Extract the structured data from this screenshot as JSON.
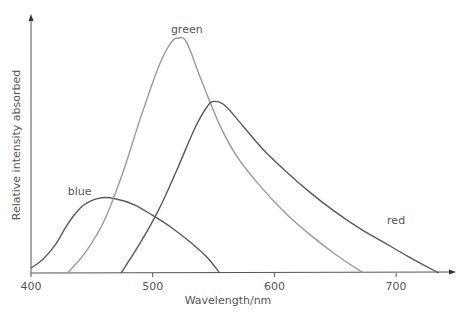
{
  "chart_data": {
    "type": "line",
    "title": "",
    "xlabel": "Wavelength/nm",
    "ylabel": "Relative intensity absorbed",
    "xlim": [
      400,
      745
    ],
    "ylim": [
      0,
      100
    ],
    "x_ticks": [
      400,
      500,
      600,
      700
    ],
    "y_ticks": [],
    "grid": false,
    "legend": "none (inline labels)",
    "series": [
      {
        "name": "blue",
        "color": "#5a5a5a",
        "label_pos": [
          440,
          33
        ],
        "points": [
          [
            400,
            2
          ],
          [
            410,
            6
          ],
          [
            420,
            12
          ],
          [
            428,
            19
          ],
          [
            436,
            25
          ],
          [
            445,
            29.5
          ],
          [
            458,
            32
          ],
          [
            470,
            31.5
          ],
          [
            485,
            29
          ],
          [
            500,
            24.5
          ],
          [
            515,
            19.5
          ],
          [
            530,
            13.5
          ],
          [
            545,
            6.5
          ],
          [
            555,
            0
          ]
        ]
      },
      {
        "name": "green",
        "color": "#9a9a9a",
        "label_pos": [
          528,
          102
        ],
        "points": [
          [
            430,
            0
          ],
          [
            445,
            9
          ],
          [
            460,
            22
          ],
          [
            475,
            42
          ],
          [
            490,
            66
          ],
          [
            505,
            88
          ],
          [
            515,
            98
          ],
          [
            521,
            100
          ],
          [
            528,
            98
          ],
          [
            540,
            82
          ],
          [
            555,
            63
          ],
          [
            570,
            49
          ],
          [
            590,
            36
          ],
          [
            610,
            25
          ],
          [
            630,
            16
          ],
          [
            650,
            8
          ],
          [
            673,
            0
          ]
        ]
      },
      {
        "name": "red",
        "color": "#5a5a5a",
        "label_pos": [
          700,
          21
        ],
        "points": [
          [
            474,
            0
          ],
          [
            490,
            13
          ],
          [
            505,
            27
          ],
          [
            520,
            44
          ],
          [
            535,
            62
          ],
          [
            545,
            71
          ],
          [
            551,
            73
          ],
          [
            560,
            71
          ],
          [
            575,
            62
          ],
          [
            590,
            53
          ],
          [
            610,
            43
          ],
          [
            630,
            34
          ],
          [
            650,
            26
          ],
          [
            670,
            19
          ],
          [
            690,
            13
          ],
          [
            710,
            7
          ],
          [
            735,
            0
          ]
        ]
      }
    ]
  }
}
